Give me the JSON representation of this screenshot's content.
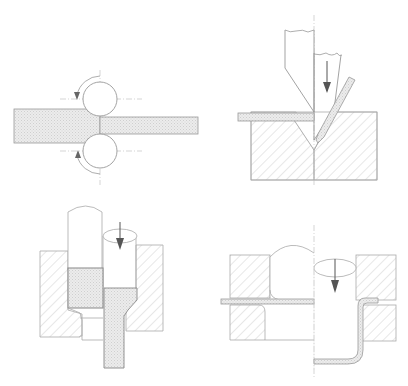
{
  "figure": {
    "panels": [
      {
        "id": "rolling",
        "description": "Strip passing between two rotating rolls, thickness reduced"
      },
      {
        "id": "bending",
        "description": "Punch pressing sheet into V-die, bent sheet shown"
      },
      {
        "id": "extrusion",
        "description": "Punch pushing billet through die, extruded rod exits below"
      },
      {
        "id": "drawing",
        "description": "Sheet clamped between blank holder and die, punch moves down forming flanged cup"
      }
    ],
    "colors": {
      "line": "#9a9a9a",
      "dark_line": "#777777",
      "hatch": "#c8c8c8",
      "workpiece_fill": "#e6e6e6",
      "arrow": "#555555",
      "background": "#ffffff"
    }
  }
}
